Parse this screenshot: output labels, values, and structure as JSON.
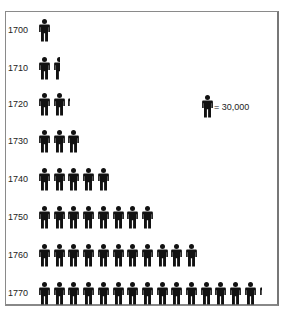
{
  "chart_data": {
    "type": "pictograph",
    "title": "",
    "xlabel": "",
    "ylabel": "",
    "unit_value": 30000,
    "legend": {
      "label": "= 30,000",
      "icon": "person-icon"
    },
    "categories": [
      "1700",
      "1710",
      "1720",
      "1730",
      "1740",
      "1750",
      "1760",
      "1770"
    ],
    "icon_counts": [
      1,
      1.5,
      2.2,
      3,
      5,
      8,
      11,
      15.1
    ],
    "values": [
      30000,
      45000,
      66000,
      90000,
      150000,
      240000,
      330000,
      453000
    ],
    "grid": false,
    "legend_position": "right-inside"
  },
  "rows": [
    {
      "year": "1700",
      "count": 1
    },
    {
      "year": "1710",
      "count": 1.5
    },
    {
      "year": "1720",
      "count": 2.2
    },
    {
      "year": "1730",
      "count": 3
    },
    {
      "year": "1740",
      "count": 5
    },
    {
      "year": "1750",
      "count": 8
    },
    {
      "year": "1760",
      "count": 11
    },
    {
      "year": "1770",
      "count": 15.1
    }
  ],
  "legend": {
    "label": "= 30,000"
  },
  "colors": {
    "icon": "#111111",
    "text": "#222222",
    "frame": "#8a8a8a"
  }
}
